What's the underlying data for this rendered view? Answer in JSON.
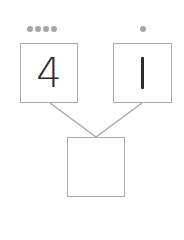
{
  "diagram": {
    "type": "number-bond",
    "left": {
      "value": "4",
      "dots": 4
    },
    "right": {
      "value": "1",
      "dots": 1
    },
    "whole": {
      "value": ""
    }
  },
  "colors": {
    "dot": "#a6a6a6",
    "border": "#a9a9a9",
    "text": "#2b2b2b"
  }
}
